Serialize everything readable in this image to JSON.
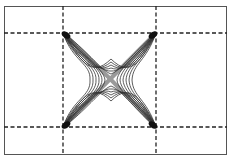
{
  "figure": {
    "colors": {
      "border": "#555555",
      "dashed_grid": "#222222",
      "contour": "#333333",
      "core_fill": "#999999",
      "background": "#ffffff"
    },
    "grid": {
      "vertical_dashed_x": [
        63,
        156
      ],
      "horizontal_dashed_y": [
        33,
        127
      ]
    },
    "corners": [
      {
        "name": "top-left",
        "x": 63,
        "y": 33
      },
      {
        "name": "top-right",
        "x": 156,
        "y": 33
      },
      {
        "name": "bottom-left",
        "x": 63,
        "y": 127
      },
      {
        "name": "bottom-right",
        "x": 156,
        "y": 127
      }
    ],
    "center": {
      "x": 111,
      "y": 80
    },
    "contour_count": 6
  }
}
